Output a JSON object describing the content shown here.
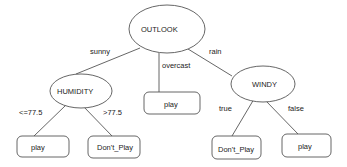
{
  "diagram": {
    "type": "decision-tree",
    "nodes": {
      "outlook": {
        "label": "OUTLOOK",
        "shape": "ellipse"
      },
      "humidity": {
        "label": "HUMIDITY",
        "shape": "ellipse"
      },
      "windy": {
        "label": "WINDY",
        "shape": "ellipse"
      },
      "overcast_leaf": {
        "label": "play",
        "shape": "rounded-rect"
      },
      "humidity_low_leaf": {
        "label": "play",
        "shape": "rounded-rect"
      },
      "humidity_high_leaf": {
        "label": "Don't_Play",
        "shape": "rounded-rect"
      },
      "windy_true_leaf": {
        "label": "Don't_Play",
        "shape": "rounded-rect"
      },
      "windy_false_leaf": {
        "label": "play",
        "shape": "rounded-rect"
      }
    },
    "edges": {
      "sunny": {
        "from": "OUTLOOK",
        "to": "HUMIDITY",
        "label": "sunny"
      },
      "overcast": {
        "from": "OUTLOOK",
        "to": "play",
        "label": "overcast"
      },
      "rain": {
        "from": "OUTLOOK",
        "to": "WINDY",
        "label": "rain"
      },
      "hum_low": {
        "from": "HUMIDITY",
        "to": "play",
        "label": "<=77.5"
      },
      "hum_high": {
        "from": "HUMIDITY",
        "to": "Don't_Play",
        "label": ">77.5"
      },
      "windy_true": {
        "from": "WINDY",
        "to": "Don't_Play",
        "label": "true"
      },
      "windy_false": {
        "from": "WINDY",
        "to": "play",
        "label": "false"
      }
    }
  }
}
